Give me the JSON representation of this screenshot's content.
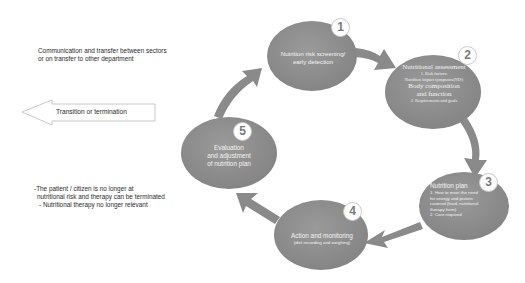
{
  "side_notes": {
    "communication": [
      "Communication and transfer between sectors",
      "or on transfer to other department"
    ],
    "transition_arrow_label": "Transition or termination",
    "termination_criteria": [
      "-The patient / citizen is no longer at",
      "nutritional risk and therapy can be terminated",
      "- Nutritional therapy no longer relevant"
    ]
  },
  "steps": [
    {
      "number": "1",
      "title": "Nutrition risk screening/",
      "title2": "early detection"
    },
    {
      "number": "2",
      "title": "Nutritional assessment",
      "line1": "1. Risk factors:",
      "line2": "Nutrition impact symptoms(NIS)",
      "title2": "Body composition",
      "title3": "and function",
      "line3": "2. Requirements and goals"
    },
    {
      "number": "3",
      "title": "Nutrition plan",
      "line1": "1. How to meet the need",
      "line2": "for energy and protein",
      "line3": "covered (food, nutritional",
      "line4": "therapy form)",
      "line5": "2. Care required"
    },
    {
      "number": "4",
      "title": "Action and monitoring",
      "line1": "(diet recording and weighing)"
    },
    {
      "number": "5",
      "title": "Evaluation",
      "title2": "and adjustment",
      "title3": "of nutrition plan"
    }
  ],
  "colors": {
    "node_fill": "#8e8e8e",
    "arrow_fill": "#8a8a8a",
    "badge_border": "#c9c9c9",
    "text": "#2a2a2a"
  }
}
